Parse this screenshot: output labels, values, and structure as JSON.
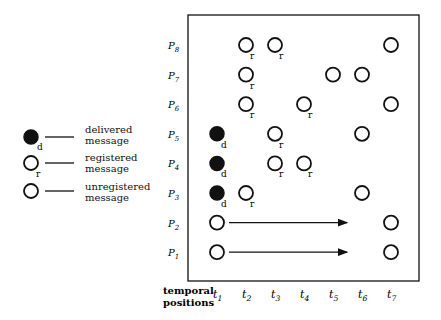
{
  "legend": {
    "items": [
      {
        "type": "delivered",
        "marker_label": "d",
        "label_line1": "delivered",
        "label_line2": "message"
      },
      {
        "type": "registered",
        "marker_label": "r",
        "label_line1": "registered",
        "label_line2": "message"
      },
      {
        "type": "unregistered",
        "marker_label": "",
        "label_line1": "unregistered",
        "label_line2": "message"
      }
    ]
  },
  "axis": {
    "xlabel_line1": "temporal",
    "xlabel_line2": "positions",
    "time_labels": [
      "t1",
      "t2",
      "t3",
      "t4",
      "t5",
      "t6",
      "t7"
    ],
    "process_labels": [
      "P8",
      "P7",
      "P6",
      "P5",
      "P4",
      "P3",
      "P2",
      "P1"
    ]
  },
  "rows": [
    {
      "process": "P8",
      "events": [
        {
          "t": 2,
          "type": "registered"
        },
        {
          "t": 3,
          "type": "registered"
        },
        {
          "t": 7,
          "type": "unregistered"
        }
      ]
    },
    {
      "process": "P7",
      "events": [
        {
          "t": 2,
          "type": "registered"
        },
        {
          "t": 5,
          "type": "unregistered"
        },
        {
          "t": 6,
          "type": "unregistered"
        }
      ]
    },
    {
      "process": "P6",
      "events": [
        {
          "t": 2,
          "type": "registered"
        },
        {
          "t": 4,
          "type": "registered"
        },
        {
          "t": 7,
          "type": "unregistered"
        }
      ]
    },
    {
      "process": "P5",
      "events": [
        {
          "t": 1,
          "type": "delivered"
        },
        {
          "t": 3,
          "type": "registered"
        },
        {
          "t": 6,
          "type": "unregistered"
        }
      ]
    },
    {
      "process": "P4",
      "events": [
        {
          "t": 1,
          "type": "delivered"
        },
        {
          "t": 3,
          "type": "registered"
        },
        {
          "t": 4,
          "type": "registered"
        }
      ]
    },
    {
      "process": "P3",
      "events": [
        {
          "t": 1,
          "type": "delivered"
        },
        {
          "t": 2,
          "type": "registered"
        },
        {
          "t": 6,
          "type": "unregistered"
        }
      ]
    },
    {
      "process": "P2",
      "events": [
        {
          "t": 1,
          "type": "unregistered"
        },
        {
          "t": 7,
          "type": "unregistered"
        }
      ],
      "arrow": {
        "from_t": 1,
        "to_t": 5
      }
    },
    {
      "process": "P1",
      "events": [
        {
          "t": 1,
          "type": "unregistered"
        },
        {
          "t": 7,
          "type": "unregistered"
        }
      ],
      "arrow": {
        "from_t": 1,
        "to_t": 5
      }
    }
  ],
  "colors": {
    "ink": "#111111",
    "background": "#ffffff"
  }
}
